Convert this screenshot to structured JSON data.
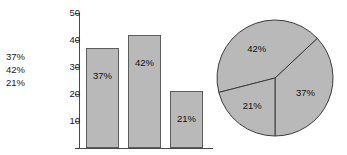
{
  "figure": {
    "cutoff_text": "",
    "legend_values": [
      "37%",
      "42%",
      "21%"
    ]
  },
  "chart_data": [
    {
      "type": "bar",
      "title": "",
      "xlabel": "",
      "ylabel": "",
      "categories": [
        "37%",
        "42%",
        "21%"
      ],
      "values": [
        37,
        42,
        21
      ],
      "data_labels": [
        "37%",
        "42%",
        "21%"
      ],
      "ylim": [
        0,
        50
      ],
      "yticks": [
        10,
        20,
        30,
        40,
        50
      ],
      "ytick_labels": [
        "10",
        "20",
        "30",
        "40",
        "50"
      ],
      "grid": false,
      "legend": "none",
      "bar_color": "#b9b9b9",
      "bar_edge_color": "#5d5d5d",
      "axis_color": "#4a4a4a"
    },
    {
      "type": "pie",
      "title": "",
      "labels": [
        "37%",
        "42%",
        "21%"
      ],
      "values": [
        37,
        42,
        21
      ],
      "data_labels": [
        "37%",
        "42%",
        "21%"
      ],
      "slice_color": "#b9b9b9",
      "slice_edge_color": "#3d3d3d",
      "start_angle_oclock": 6,
      "direction": "counterclockwise",
      "legend": "none"
    }
  ]
}
